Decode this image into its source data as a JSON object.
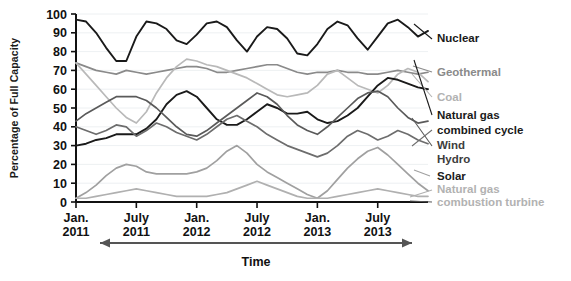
{
  "chart_data": {
    "type": "line",
    "title": "",
    "xlabel": "Time",
    "ylabel": "Percentage of Full Capacity",
    "ylim": [
      0,
      100
    ],
    "yticks": [
      0,
      10,
      20,
      30,
      40,
      50,
      60,
      70,
      80,
      90,
      100
    ],
    "grid": true,
    "legend_position": "right",
    "categories": [
      "Jan. 2011",
      "Feb. 2011",
      "Mar. 2011",
      "Apr. 2011",
      "May 2011",
      "June 2011",
      "July 2011",
      "Aug. 2011",
      "Sep. 2011",
      "Oct. 2011",
      "Nov. 2011",
      "Dec. 2011",
      "Jan. 2012",
      "Feb. 2012",
      "Mar. 2012",
      "Apr. 2012",
      "May 2012",
      "June 2012",
      "July 2012",
      "Aug. 2012",
      "Sep. 2012",
      "Oct. 2012",
      "Nov. 2012",
      "Dec. 2012",
      "Jan. 2013",
      "Feb. 2013",
      "Mar. 2013",
      "Apr. 2013",
      "May 2013",
      "June 2013",
      "July 2013",
      "Aug. 2013",
      "Sep. 2013",
      "Oct. 2013",
      "Nov. 2013",
      "Dec. 2013"
    ],
    "xticks": [
      "Jan. 2011",
      "July 2011",
      "Jan. 2012",
      "July 2012",
      "Jan. 2013",
      "July 2013"
    ],
    "xtick_lines": [
      [
        "Jan.",
        "2011"
      ],
      [
        "July",
        "2011"
      ],
      [
        "Jan.",
        "2012"
      ],
      [
        "July",
        "2012"
      ],
      [
        "Jan.",
        "2013"
      ],
      [
        "July",
        "2013"
      ]
    ],
    "series": [
      {
        "name": "Nuclear",
        "color": "#1a1a1a",
        "width": 1.9,
        "label_weight": "bold",
        "values": [
          97,
          96,
          90,
          82,
          75,
          75,
          88,
          96,
          95,
          92,
          86,
          84,
          89,
          95,
          96,
          93,
          86,
          80,
          88,
          93,
          92,
          87,
          79,
          78,
          84,
          92,
          96,
          94,
          87,
          81,
          88,
          95,
          97,
          93,
          88,
          91
        ]
      },
      {
        "name": "Geothermal",
        "color": "#8a8a8a",
        "width": 1.7,
        "label_weight": "bold",
        "values": [
          74,
          72,
          70,
          69,
          68,
          70,
          69,
          68,
          69,
          70,
          71,
          72,
          72,
          71,
          69,
          69,
          70,
          71,
          72,
          73,
          73,
          71,
          69,
          68,
          69,
          69,
          70,
          69,
          69,
          68,
          68,
          69,
          70,
          69,
          68,
          69
        ]
      },
      {
        "name": "Coal",
        "color": "#b9b9b9",
        "width": 1.7,
        "label_weight": "bold",
        "values": [
          74,
          68,
          62,
          56,
          50,
          45,
          42,
          48,
          58,
          66,
          72,
          76,
          75,
          73,
          72,
          70,
          68,
          66,
          63,
          60,
          57,
          56,
          57,
          58,
          62,
          68,
          70,
          66,
          62,
          60,
          58,
          62,
          68,
          71,
          69,
          64
        ]
      },
      {
        "name": "Natural gas combined cycle",
        "color": "#1a1a1a",
        "width": 1.9,
        "label_weight": "bold",
        "values": [
          30,
          31,
          33,
          34,
          36,
          36,
          36,
          39,
          44,
          52,
          57,
          59,
          56,
          50,
          44,
          41,
          41,
          44,
          48,
          52,
          50,
          47,
          47,
          48,
          44,
          42,
          43,
          46,
          50,
          56,
          62,
          66,
          65,
          63,
          61,
          60
        ]
      },
      {
        "name": "Wind",
        "color": "#5a5a5a",
        "width": 1.7,
        "label_weight": "bold",
        "values": [
          43,
          47,
          50,
          53,
          56,
          56,
          56,
          54,
          50,
          45,
          40,
          36,
          35,
          38,
          42,
          46,
          50,
          54,
          58,
          56,
          52,
          46,
          41,
          38,
          36,
          40,
          45,
          50,
          55,
          58,
          59,
          56,
          50,
          45,
          42,
          43
        ]
      },
      {
        "name": "Hydro",
        "color": "#6d6d6d",
        "width": 1.7,
        "label_weight": "bold",
        "values": [
          40,
          38,
          36,
          38,
          41,
          40,
          35,
          38,
          42,
          40,
          37,
          35,
          33,
          36,
          40,
          44,
          46,
          43,
          40,
          36,
          33,
          30,
          28,
          26,
          24,
          26,
          30,
          35,
          38,
          36,
          33,
          35,
          38,
          36,
          33,
          31
        ]
      },
      {
        "name": "Solar",
        "color": "#a0a0a0",
        "width": 1.7,
        "label_weight": "bold",
        "values": [
          2,
          5,
          9,
          14,
          18,
          20,
          19,
          16,
          15,
          15,
          15,
          15,
          16,
          18,
          22,
          27,
          30,
          26,
          20,
          16,
          13,
          10,
          7,
          4,
          2,
          6,
          12,
          18,
          23,
          27,
          29,
          25,
          20,
          15,
          10,
          6
        ]
      },
      {
        "name": "Natural gas combustion turbine",
        "color": "#b0b0b0",
        "width": 1.7,
        "label_weight": "bold",
        "values": [
          2,
          2,
          3,
          4,
          5,
          6,
          7,
          6,
          5,
          4,
          3,
          3,
          3,
          3,
          4,
          5,
          7,
          9,
          11,
          9,
          7,
          5,
          3,
          2,
          2,
          2,
          3,
          4,
          5,
          6,
          7,
          6,
          5,
          4,
          3,
          3
        ]
      }
    ],
    "legend": [
      {
        "label": "Nuclear",
        "color": "#1a1a1a",
        "weight": "bold"
      },
      {
        "label": "Geothermal",
        "color": "#8a8a8a",
        "weight": "bold"
      },
      {
        "label": "Coal",
        "color": "#b2b2b2",
        "weight": "bold"
      },
      {
        "label": "Natural gas",
        "color": "#1a1a1a",
        "weight": "bold"
      },
      {
        "label": "combined cycle",
        "color": "#1a1a1a",
        "weight": "bold"
      },
      {
        "label": "Wind",
        "color": "#3d3d3d",
        "weight": "bold"
      },
      {
        "label": "Hydro",
        "color": "#3d3d3d",
        "weight": "bold"
      },
      {
        "label": "Solar",
        "color": "#1a1a1a",
        "weight": "bold"
      },
      {
        "label": "Natural gas",
        "color": "#b2b2b2",
        "weight": "bold"
      },
      {
        "label": "combustion turbine",
        "color": "#b2b2b2",
        "weight": "bold"
      }
    ]
  }
}
